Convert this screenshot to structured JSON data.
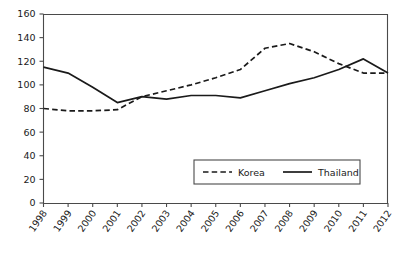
{
  "chart_data": {
    "type": "line",
    "title": "",
    "xlabel": "",
    "ylabel": "",
    "ylim": [
      0,
      160
    ],
    "ytick_step": 20,
    "yticks": [
      "0",
      "20",
      "40",
      "60",
      "80",
      "100",
      "120",
      "140",
      "160"
    ],
    "grid": false,
    "legend_position": "bottom-center",
    "categories": [
      "1998",
      "1999",
      "2000",
      "2001",
      "2002",
      "2003",
      "2004",
      "2005",
      "2006",
      "2007",
      "2008",
      "2009",
      "2010",
      "2011",
      "2012"
    ],
    "series": [
      {
        "name": "Korea",
        "style": "dashed",
        "color": "#1a1a1a",
        "values": [
          80,
          78,
          78,
          79,
          90,
          95,
          100,
          106,
          113,
          131,
          135,
          128,
          118,
          110,
          110
        ]
      },
      {
        "name": "Thailand",
        "style": "solid",
        "color": "#1a1a1a",
        "values": [
          115,
          110,
          98,
          85,
          90,
          88,
          91,
          91,
          89,
          95,
          101,
          106,
          113,
          122,
          110
        ]
      }
    ]
  },
  "legend": {
    "items": [
      {
        "label": "Korea",
        "style": "dashed"
      },
      {
        "label": "Thailand",
        "style": "solid"
      }
    ]
  }
}
